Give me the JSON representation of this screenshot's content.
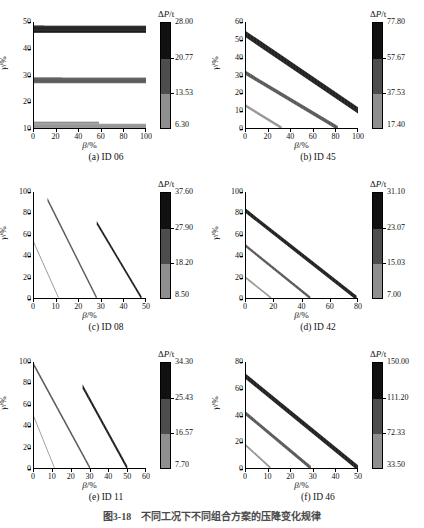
{
  "figure": {
    "caption": "图3-18　不同工况下不同组合方案的压降变化规律",
    "xlabel_sym": "β",
    "xlabel_unit": "/%",
    "ylabel_sym": "γ",
    "ylabel_unit": "/%",
    "colorbar_title_delta": "Δ",
    "colorbar_title_p": "P",
    "colorbar_title_unit": "/t"
  },
  "palette": {
    "band_light": "#8f8f8f",
    "band_mid": "#4d4d4d",
    "band_dark": "#111111",
    "axis": "#000000",
    "background": "#ffffff"
  },
  "chart_data": [
    {
      "id": "a",
      "type": "area",
      "title": "(a) ID 06",
      "xlabel": "β/%",
      "ylabel": "γ/%",
      "xlim": [
        0,
        100
      ],
      "ylim": [
        10,
        50
      ],
      "xticks": [
        0,
        20,
        40,
        60,
        80,
        100
      ],
      "yticks": [
        10,
        20,
        30,
        40,
        50
      ],
      "grid": false,
      "orientation": "horizontal-bands",
      "colorbar": {
        "ticks": [
          6.3,
          13.53,
          20.77,
          28.0
        ],
        "labels": [
          "6.30",
          "13.53",
          "20.77",
          "28.00"
        ],
        "vmin": 6.3,
        "vmax": 28.0,
        "levels": [
          "#8f8f8f",
          "#4d4d4d",
          "#111111"
        ]
      },
      "series": [
        {
          "name": "low",
          "level": "light",
          "shape": "band_h",
          "x0": 0,
          "x1": 100,
          "y_lo": 10.0,
          "y_hi": 11.6,
          "step_x": 58,
          "step_y_hi": 12.4
        },
        {
          "name": "mid",
          "level": "mid",
          "shape": "band_h",
          "x0": 0,
          "x1": 100,
          "y_lo": 26.9,
          "y_hi": 29.0,
          "step_x": 25,
          "step_y_hi": 28.2
        },
        {
          "name": "high",
          "level": "dark",
          "shape": "band_h",
          "x0": 0,
          "x1": 100,
          "y_lo": 45.9,
          "y_hi": 48.6,
          "step_x": 9,
          "step_y_hi": 48.6
        }
      ]
    },
    {
      "id": "b",
      "type": "area",
      "title": "(b) ID 45",
      "xlabel": "β/%",
      "ylabel": "γ/%",
      "xlim": [
        0,
        100
      ],
      "ylim": [
        0,
        60
      ],
      "xticks": [
        0,
        20,
        40,
        60,
        80,
        100
      ],
      "yticks": [
        0,
        10,
        20,
        30,
        40,
        50,
        60
      ],
      "grid": false,
      "orientation": "diagonal",
      "colorbar": {
        "ticks": [
          17.4,
          37.53,
          57.67,
          77.8
        ],
        "labels": [
          "17.40",
          "37.53",
          "57.67",
          "77.80"
        ],
        "vmin": 17.4,
        "vmax": 77.8,
        "levels": [
          "#8f8f8f",
          "#4d4d4d",
          "#111111"
        ]
      },
      "series": [
        {
          "name": "low",
          "level": "light",
          "shape": "band_d",
          "x_start": 0,
          "y_start": 12.5,
          "x_end": 32,
          "y_end": 0,
          "width": 1.6
        },
        {
          "name": "mid",
          "level": "mid",
          "shape": "band_d",
          "x_start": 0,
          "y_start": 31.0,
          "x_end": 82,
          "y_end": 0,
          "width": 2.4
        },
        {
          "name": "high",
          "level": "dark",
          "shape": "band_d",
          "x_start": 0,
          "y_start": 53.0,
          "x_end": 100,
          "y_end": 10.0,
          "width": 3.6
        }
      ]
    },
    {
      "id": "c",
      "type": "area",
      "title": "(c) ID 08",
      "xlabel": "β/%",
      "ylabel": "γ/%",
      "xlim": [
        0,
        50
      ],
      "ylim": [
        0,
        100
      ],
      "xticks": [
        0,
        10,
        20,
        30,
        40,
        50
      ],
      "yticks": [
        0,
        20,
        40,
        60,
        80,
        100
      ],
      "grid": false,
      "orientation": "diagonal-steep",
      "colorbar": {
        "ticks": [
          8.5,
          18.2,
          27.9,
          37.6
        ],
        "labels": [
          "8.50",
          "18.20",
          "27.90",
          "37.60"
        ],
        "vmin": 8.5,
        "vmax": 37.6,
        "levels": [
          "#8f8f8f",
          "#4d4d4d",
          "#111111"
        ]
      },
      "series": [
        {
          "name": "low",
          "level": "light",
          "shape": "band_d",
          "x_start": 0,
          "y_start": 52.0,
          "x_end": 11,
          "y_end": 0,
          "width": 2.0
        },
        {
          "name": "mid",
          "level": "mid",
          "shape": "band_d",
          "x_start": 6,
          "y_start": 93.0,
          "x_end": 28,
          "y_end": 0,
          "width": 3.0
        },
        {
          "name": "high",
          "level": "dark",
          "shape": "band_d",
          "x_start": 28,
          "y_start": 71.0,
          "x_end": 48,
          "y_end": 0,
          "width": 3.2
        }
      ]
    },
    {
      "id": "d",
      "type": "area",
      "title": "(d) ID 42",
      "xlabel": "β/%",
      "ylabel": "γ/%",
      "xlim": [
        0,
        80
      ],
      "ylim": [
        0,
        100
      ],
      "xticks": [
        0,
        20,
        40,
        60,
        80
      ],
      "yticks": [
        0,
        20,
        40,
        60,
        80,
        100
      ],
      "grid": false,
      "orientation": "diagonal",
      "colorbar": {
        "ticks": [
          7.0,
          15.03,
          23.07,
          31.1
        ],
        "labels": [
          "7.00",
          "15.03",
          "23.07",
          "31.10"
        ],
        "vmin": 7.0,
        "vmax": 31.1,
        "levels": [
          "#8f8f8f",
          "#4d4d4d",
          "#111111"
        ]
      },
      "series": [
        {
          "name": "low",
          "level": "light",
          "shape": "band_d",
          "x_start": 0,
          "y_start": 19.0,
          "x_end": 18,
          "y_end": 0,
          "width": 2.0
        },
        {
          "name": "mid",
          "level": "mid",
          "shape": "band_d",
          "x_start": 0,
          "y_start": 49.0,
          "x_end": 46,
          "y_end": 0,
          "width": 2.8
        },
        {
          "name": "high",
          "level": "dark",
          "shape": "band_d",
          "x_start": 0,
          "y_start": 82.0,
          "x_end": 79,
          "y_end": 0,
          "width": 4.2
        }
      ]
    },
    {
      "id": "e",
      "type": "area",
      "title": "(e) ID 11",
      "xlabel": "β/%",
      "ylabel": "γ/%",
      "xlim": [
        0,
        60
      ],
      "ylim": [
        0,
        100
      ],
      "xticks": [
        0,
        10,
        20,
        30,
        40,
        50,
        60
      ],
      "yticks": [
        0,
        20,
        40,
        60,
        80,
        100
      ],
      "grid": false,
      "orientation": "diagonal-steep",
      "colorbar": {
        "ticks": [
          7.7,
          16.57,
          25.43,
          34.3
        ],
        "labels": [
          "7.70",
          "16.57",
          "25.43",
          "34.30"
        ],
        "vmin": 7.7,
        "vmax": 34.3,
        "levels": [
          "#8f8f8f",
          "#4d4d4d",
          "#111111"
        ]
      },
      "series": [
        {
          "name": "low",
          "level": "light",
          "shape": "band_d",
          "x_start": 0,
          "y_start": 48.0,
          "x_end": 11,
          "y_end": 0,
          "width": 2.0
        },
        {
          "name": "mid",
          "level": "mid",
          "shape": "band_d",
          "x_start": 0,
          "y_start": 97.0,
          "x_end": 30,
          "y_end": 0,
          "width": 3.0
        },
        {
          "name": "high",
          "level": "dark",
          "shape": "band_d",
          "x_start": 26,
          "y_start": 77.0,
          "x_end": 50,
          "y_end": 0,
          "width": 4.0
        }
      ]
    },
    {
      "id": "f",
      "type": "area",
      "title": "(f) ID 46",
      "xlabel": "β/%",
      "ylabel": "γ/%",
      "xlim": [
        0,
        50
      ],
      "ylim": [
        0,
        80
      ],
      "xticks": [
        0,
        10,
        20,
        30,
        40,
        50
      ],
      "yticks": [
        0,
        20,
        40,
        60,
        80
      ],
      "grid": false,
      "orientation": "diagonal",
      "colorbar": {
        "ticks": [
          33.5,
          72.33,
          111.2,
          150.0
        ],
        "labels": [
          "33.50",
          "72.33",
          "111.20",
          "150.00"
        ],
        "vmin": 33.5,
        "vmax": 150.0,
        "levels": [
          "#8f8f8f",
          "#4d4d4d",
          "#111111"
        ]
      },
      "series": [
        {
          "name": "low",
          "level": "light",
          "shape": "band_d",
          "x_start": 0,
          "y_start": 17.0,
          "x_end": 11,
          "y_end": 0,
          "width": 1.8
        },
        {
          "name": "mid",
          "level": "mid",
          "shape": "band_d",
          "x_start": 0,
          "y_start": 41.0,
          "x_end": 29,
          "y_end": 0,
          "width": 3.0
        },
        {
          "name": "high",
          "level": "dark",
          "shape": "band_d",
          "x_start": 0,
          "y_start": 69.0,
          "x_end": 50,
          "y_end": 0,
          "width": 4.0
        }
      ]
    }
  ]
}
